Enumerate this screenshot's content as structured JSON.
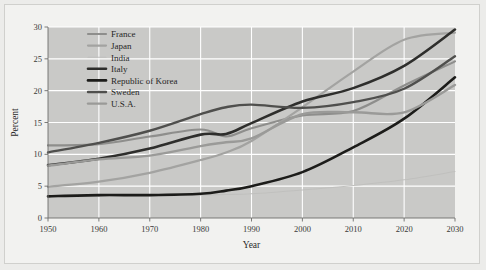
{
  "chart_data": {
    "type": "line",
    "title": "",
    "xlabel": "Year",
    "ylabel": "Percent",
    "xlim": [
      1950,
      2030
    ],
    "ylim": [
      0,
      30
    ],
    "xticks": [
      1950,
      1960,
      1970,
      1980,
      1990,
      2000,
      2010,
      2020,
      2030
    ],
    "yticks": [
      0,
      5,
      10,
      15,
      20,
      25,
      30
    ],
    "grid": true,
    "legend_position": "top-left",
    "x": [
      1950,
      1960,
      1970,
      1980,
      1985,
      1990,
      2000,
      2010,
      2020,
      2030
    ],
    "series": [
      {
        "name": "France",
        "color": "#8e8e8c",
        "width": 2.2,
        "values": [
          11.4,
          11.6,
          12.8,
          13.9,
          12.8,
          14.1,
          16.1,
          16.8,
          20.8,
          24.6
        ]
      },
      {
        "name": "Japan",
        "color": "#a3a3a1",
        "width": 2.2,
        "values": [
          4.9,
          5.7,
          7.1,
          9.1,
          10.3,
          12.1,
          17.4,
          23.0,
          28.0,
          29.1
        ]
      },
      {
        "name": "India",
        "color": "#c0c0be",
        "width": 1.1,
        "values": [
          3.3,
          3.4,
          3.5,
          3.6,
          3.7,
          3.8,
          4.4,
          5.1,
          6.0,
          7.3
        ]
      },
      {
        "name": "Italy",
        "color": "#2e2e2c",
        "width": 2.6,
        "values": [
          8.3,
          9.3,
          10.9,
          13.1,
          13.2,
          14.9,
          18.3,
          20.4,
          23.9,
          29.6
        ]
      },
      {
        "name": "Republic of Korea",
        "color": "#1c1c1a",
        "width": 2.6,
        "values": [
          3.4,
          3.6,
          3.6,
          3.8,
          4.3,
          5.0,
          7.2,
          11.1,
          15.6,
          22.1
        ]
      },
      {
        "name": "Sweden",
        "color": "#4f4f4d",
        "width": 2.4,
        "values": [
          10.3,
          11.8,
          13.7,
          16.3,
          17.4,
          17.8,
          17.3,
          18.2,
          20.3,
          25.4
        ]
      },
      {
        "name": "U.S.A.",
        "color": "#9a9a98",
        "width": 2.4,
        "values": [
          8.2,
          9.2,
          9.8,
          11.3,
          11.9,
          12.5,
          16.3,
          16.6,
          16.6,
          20.9
        ]
      }
    ]
  },
  "legend": {
    "items": [
      {
        "label": "France"
      },
      {
        "label": "Japan"
      },
      {
        "label": "India"
      },
      {
        "label": "Italy"
      },
      {
        "label": "Republic of Korea"
      },
      {
        "label": "Sweden"
      },
      {
        "label": "U.S.A."
      }
    ]
  }
}
